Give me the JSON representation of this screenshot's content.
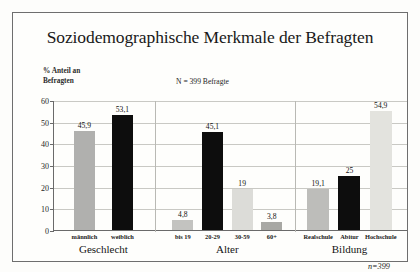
{
  "title": "Soziodemographische Merkmale der Befragten",
  "ylabel_line1": "% Anteil an",
  "ylabel_line2": "Befragten",
  "n_note": "N = 399 Befragte",
  "n_italic": "n=399",
  "chart_data": {
    "type": "bar",
    "title": "Soziodemographische Merkmale der Befragten",
    "subtitle": "N = 399 Befragte",
    "xlabel": "",
    "ylabel": "% Anteil an Befragten",
    "ylim": [
      0,
      60
    ],
    "yticks": [
      0,
      10,
      20,
      30,
      40,
      50,
      60
    ],
    "grid": true,
    "legend": "none",
    "annotation": "n=399",
    "groups": [
      {
        "name": "Geschlecht",
        "categories": [
          "männlich",
          "weiblich"
        ],
        "values": [
          45.9,
          53.1
        ],
        "value_labels": [
          "45,9",
          "53,1"
        ],
        "colors": [
          "#b0b0ae",
          "#0d0d0d"
        ]
      },
      {
        "name": "Alter",
        "categories": [
          "bis 19",
          "20-29",
          "30-59",
          "60+"
        ],
        "values": [
          4.8,
          45.1,
          19,
          3.8
        ],
        "value_labels": [
          "4,8",
          "45,1",
          "19",
          "3,8"
        ],
        "colors": [
          "#c3c3c0",
          "#0d0d0d",
          "#dcdcd8",
          "#a8a8a4"
        ]
      },
      {
        "name": "Bildung",
        "categories": [
          "Realschule",
          "Abitur",
          "Hochschule"
        ],
        "values": [
          19.1,
          25,
          54.9
        ],
        "value_labels": [
          "19,1",
          "25",
          "54,9"
        ],
        "colors": [
          "#bdbdba",
          "#0d0d0d",
          "#e3e3de"
        ]
      }
    ]
  }
}
